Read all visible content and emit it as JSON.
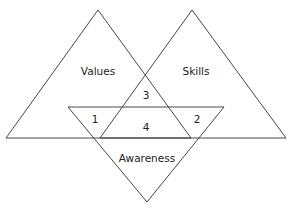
{
  "diagram": {
    "title": "",
    "shapes": {
      "values_triangle": {
        "label": "Values"
      },
      "skills_triangle": {
        "label": "Skills"
      },
      "awareness_triangle": {
        "label": "Awareness"
      }
    },
    "regions": [
      {
        "id": "1",
        "label": "1"
      },
      {
        "id": "2",
        "label": "2"
      },
      {
        "id": "3",
        "label": "3"
      },
      {
        "id": "4",
        "label": "4"
      }
    ],
    "colors": {
      "stroke": "#333333",
      "text": "#222222",
      "background": "#ffffff"
    }
  }
}
